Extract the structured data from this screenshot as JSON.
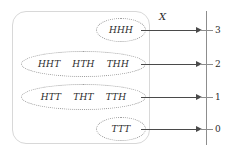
{
  "diagram": {
    "map_label": "X",
    "sample_space_name": "sample-space",
    "colors": {
      "box_border": "#d8d8d8",
      "ellipse_border": "#9a9a9a",
      "arrow": "#4a4a4a",
      "axis": "#8d8d8d",
      "text": "#2b2b2b"
    },
    "events": [
      {
        "id": "event-three-heads",
        "outcomes": [
          "HHH"
        ],
        "maps_to": "3"
      },
      {
        "id": "event-two-heads",
        "outcomes": [
          "HHT",
          "HTH",
          "THH"
        ],
        "maps_to": "2"
      },
      {
        "id": "event-one-head",
        "outcomes": [
          "HTT",
          "THT",
          "TTH"
        ],
        "maps_to": "1"
      },
      {
        "id": "event-zero-heads",
        "outcomes": [
          "TTT"
        ],
        "maps_to": "0"
      }
    ],
    "axis": {
      "ticks": [
        "3",
        "2",
        "1",
        "0"
      ]
    }
  }
}
